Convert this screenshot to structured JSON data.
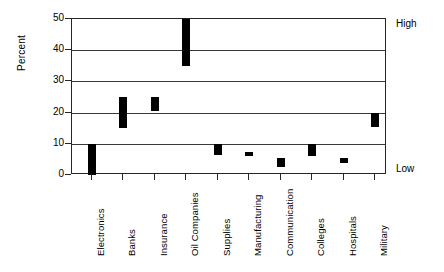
{
  "chart_data": {
    "type": "bar",
    "bar_style": "floating-range",
    "title": "",
    "subtitle": "",
    "xlabel": "",
    "ylabel": "Percent",
    "ylim": [
      0,
      50
    ],
    "yticks": [
      0,
      10,
      20,
      30,
      40,
      50
    ],
    "ytick_labels": [
      "0",
      "10",
      "20",
      "30",
      "40",
      "50"
    ],
    "grid": true,
    "grid_axis": "y",
    "legend": null,
    "legend_position": "none",
    "bar_color": "#000000",
    "categories": [
      "Electronics",
      "Banks",
      "Insurance",
      "Oil Companies",
      "Supplies",
      "Manufacturing",
      "Communication",
      "Colleges",
      "Hospitals",
      "Military"
    ],
    "low": [
      0,
      15,
      20.5,
      35,
      6.5,
      6,
      2.5,
      6,
      4,
      15.5
    ],
    "high": [
      10,
      25,
      25,
      50,
      10,
      7.5,
      5.5,
      10,
      5.5,
      20
    ],
    "series": [
      {
        "name": "Percent range",
        "points": [
          {
            "category": "Electronics",
            "low": 0,
            "high": 10
          },
          {
            "category": "Banks",
            "low": 15,
            "high": 25
          },
          {
            "category": "Insurance",
            "low": 20.5,
            "high": 25
          },
          {
            "category": "Oil Companies",
            "low": 35,
            "high": 50
          },
          {
            "category": "Supplies",
            "low": 6.5,
            "high": 10
          },
          {
            "category": "Manufacturing",
            "low": 6,
            "high": 7.5
          },
          {
            "category": "Communication",
            "low": 2.5,
            "high": 5.5
          },
          {
            "category": "Colleges",
            "low": 6,
            "high": 10
          },
          {
            "category": "Hospitals",
            "low": 4,
            "high": 5.5
          },
          {
            "category": "Military",
            "low": 15.5,
            "high": 20
          }
        ]
      }
    ],
    "annotations": [
      {
        "text": "High",
        "position": "top-right"
      },
      {
        "text": "Low",
        "position": "bottom-right"
      }
    ]
  },
  "axis": {
    "y_title": "Percent"
  },
  "notes": {
    "high": "High",
    "low": "Low"
  }
}
